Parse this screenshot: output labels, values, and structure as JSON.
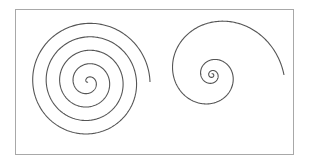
{
  "figure": {
    "frame": {
      "stroke": "#a8a8a8"
    },
    "stroke_color": "#555555",
    "spirals": [
      {
        "name": "archimedean-spiral",
        "type": "archimedean",
        "cx": 88,
        "cy": 82,
        "turns": 4.6,
        "outer_radius": 62,
        "start_angle_deg": 0,
        "direction": "clockwise-outward"
      },
      {
        "name": "logarithmic-spiral",
        "type": "logarithmic",
        "cx": 212,
        "cy": 75,
        "turns": 3.3,
        "outer_radius": 72,
        "inner_radius": 1.2
      }
    ]
  }
}
